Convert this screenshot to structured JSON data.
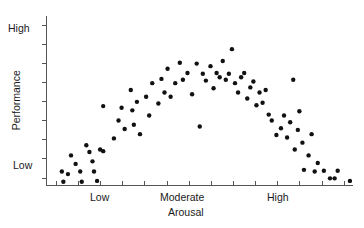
{
  "chart_data": {
    "type": "scatter",
    "title": "",
    "xlabel": "Arousal",
    "ylabel": "Performance",
    "grid": false,
    "legend": null,
    "xlim": [
      0,
      100
    ],
    "ylim": [
      0,
      100
    ],
    "x_tick_labels": [
      "Low",
      "Moderate",
      "High"
    ],
    "y_tick_labels": [
      "Low",
      "High"
    ],
    "x_tick_label_positions": [
      17,
      50,
      83
    ],
    "y_tick_label_positions": [
      11,
      89
    ],
    "x_minor_tick_count": 14,
    "y_minor_tick_count": 9,
    "points": [
      [
        5.0,
        8.5
      ],
      [
        5.5,
        2.5
      ],
      [
        7.0,
        7.0
      ],
      [
        8.0,
        18.0
      ],
      [
        9.5,
        13.0
      ],
      [
        11.0,
        8.5
      ],
      [
        11.5,
        2.5
      ],
      [
        13.0,
        24.0
      ],
      [
        14.0,
        20.0
      ],
      [
        15.0,
        14.5
      ],
      [
        15.5,
        8.5
      ],
      [
        16.5,
        3.0
      ],
      [
        17.5,
        21.5
      ],
      [
        18.5,
        20.5
      ],
      [
        18.5,
        47.0
      ],
      [
        22.0,
        28.0
      ],
      [
        23.5,
        38.5
      ],
      [
        24.5,
        46.0
      ],
      [
        25.5,
        33.5
      ],
      [
        27.5,
        56.5
      ],
      [
        28.0,
        44.5
      ],
      [
        28.5,
        36.0
      ],
      [
        29.5,
        49.5
      ],
      [
        30.5,
        30.5
      ],
      [
        32.5,
        52.5
      ],
      [
        33.5,
        41.5
      ],
      [
        34.5,
        60.5
      ],
      [
        36.5,
        48.5
      ],
      [
        37.5,
        63.0
      ],
      [
        38.5,
        55.0
      ],
      [
        39.5,
        69.0
      ],
      [
        40.5,
        52.5
      ],
      [
        42.0,
        60.5
      ],
      [
        43.5,
        72.5
      ],
      [
        44.5,
        62.5
      ],
      [
        46.0,
        66.5
      ],
      [
        47.5,
        54.0
      ],
      [
        49.0,
        72.0
      ],
      [
        50.0,
        35.0
      ],
      [
        51.0,
        66.0
      ],
      [
        52.0,
        62.0
      ],
      [
        53.5,
        70.5
      ],
      [
        54.5,
        57.5
      ],
      [
        55.5,
        66.5
      ],
      [
        56.5,
        64.0
      ],
      [
        57.5,
        73.5
      ],
      [
        58.5,
        62.5
      ],
      [
        59.5,
        66.0
      ],
      [
        60.5,
        80.5
      ],
      [
        61.5,
        60.5
      ],
      [
        62.5,
        55.0
      ],
      [
        63.5,
        64.0
      ],
      [
        64.5,
        66.5
      ],
      [
        65.5,
        51.5
      ],
      [
        66.5,
        58.0
      ],
      [
        67.5,
        61.5
      ],
      [
        68.5,
        47.5
      ],
      [
        69.5,
        55.0
      ],
      [
        70.5,
        49.0
      ],
      [
        71.5,
        56.5
      ],
      [
        72.5,
        42.0
      ],
      [
        73.5,
        38.5
      ],
      [
        75.0,
        30.0
      ],
      [
        76.5,
        34.0
      ],
      [
        77.5,
        41.5
      ],
      [
        78.5,
        28.5
      ],
      [
        79.5,
        37.5
      ],
      [
        80.5,
        62.5
      ],
      [
        81.0,
        21.5
      ],
      [
        82.0,
        33.0
      ],
      [
        82.5,
        44.0
      ],
      [
        83.5,
        25.5
      ],
      [
        84.0,
        9.5
      ],
      [
        85.5,
        18.0
      ],
      [
        86.5,
        30.5
      ],
      [
        87.5,
        8.5
      ],
      [
        88.5,
        13.5
      ],
      [
        90.5,
        9.0
      ],
      [
        92.5,
        4.5
      ],
      [
        94.0,
        4.5
      ],
      [
        95.0,
        9.0
      ],
      [
        99.0,
        3.0
      ]
    ]
  },
  "axes": {
    "y_label_high": "High",
    "y_label_low": "Low",
    "x_label_low": "Low",
    "x_label_moderate": "Moderate",
    "x_label_high": "High",
    "x_title": "Arousal",
    "y_title": "Performance"
  },
  "colors": {
    "point": "#111111",
    "axis": "#555555",
    "background": "#ffffff",
    "text": "#1a1a1a"
  }
}
